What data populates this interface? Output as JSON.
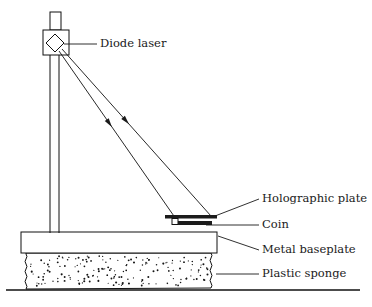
{
  "figure": {
    "kind": "technical-line-diagram",
    "background_color": "#ffffff",
    "ink_color": "#111111"
  },
  "labels": [
    {
      "id": "diode-laser",
      "text": "Diode laser",
      "text_x": 100,
      "text_y": 44,
      "leader": {
        "x1": 64,
        "y1": 44,
        "x2": 97,
        "y2": 44
      }
    },
    {
      "id": "holographic-plate",
      "text": "Holographic plate",
      "text_x": 262,
      "text_y": 199,
      "leader": {
        "x1": 215,
        "y1": 216,
        "x2": 259,
        "y2": 199
      }
    },
    {
      "id": "coin",
      "text": "Coin",
      "text_x": 262,
      "text_y": 225,
      "leader": {
        "x1": 206,
        "y1": 225,
        "x2": 259,
        "y2": 225
      }
    },
    {
      "id": "metal-baseplate",
      "text": "Metal baseplate",
      "text_x": 262,
      "text_y": 250,
      "leader": {
        "x1": 218,
        "y1": 236,
        "x2": 259,
        "y2": 250
      }
    },
    {
      "id": "plastic-sponge",
      "text": "Plastic sponge",
      "text_x": 262,
      "text_y": 274,
      "leader": {
        "x1": 216,
        "y1": 274,
        "x2": 259,
        "y2": 274
      }
    }
  ],
  "components": {
    "laser_head": {
      "box": {
        "x": 43,
        "y": 30,
        "width": 26,
        "height": 25
      },
      "diamond_center": {
        "x": 55,
        "y": 43
      },
      "diamond_radius": 9,
      "stem": {
        "x": 50,
        "y": 12,
        "width": 11,
        "height": 18
      }
    },
    "post": {
      "left_x": 50,
      "right_x": 59,
      "top_y": 55,
      "bottom_y": 233
    },
    "beams": [
      {
        "x1": 59,
        "y1": 51,
        "x2": 176,
        "y2": 219,
        "arrow_t": 0.43
      },
      {
        "x1": 62,
        "y1": 49,
        "x2": 211,
        "y2": 216,
        "arrow_t": 0.43
      }
    ],
    "holographic_plate": {
      "x": 165,
      "y": 215,
      "width": 52,
      "height": 3.5
    },
    "plate_support": {
      "x": 172,
      "y": 218.5,
      "width": 6,
      "height": 6
    },
    "coin": {
      "x": 178,
      "y": 221,
      "width": 34,
      "height": 4
    },
    "baseplate": {
      "x": 21,
      "y": 232,
      "width": 196,
      "height": 21
    },
    "sponge": {
      "x": 26,
      "y": 253,
      "width": 185,
      "height": 36,
      "speck_count": 168
    },
    "ground_line": {
      "x1": 6,
      "y1": 290,
      "x2": 360,
      "y2": 290
    }
  }
}
